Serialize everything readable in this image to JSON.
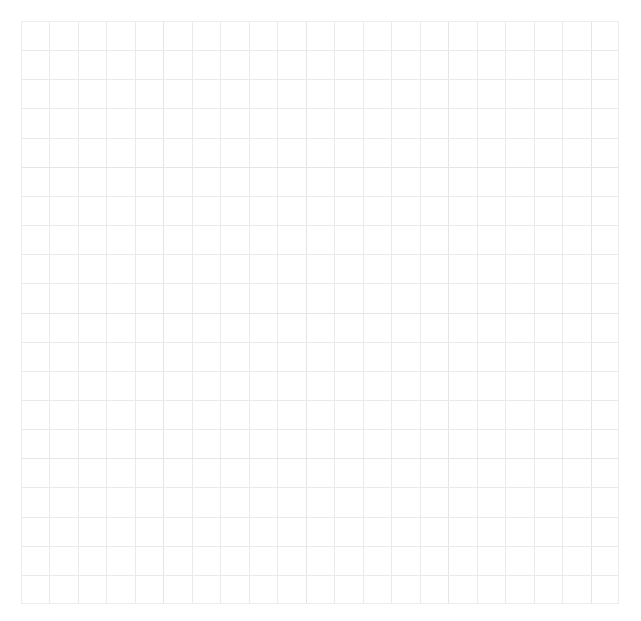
{
  "figure": {
    "background_color": "#ffffff",
    "width": 641,
    "height": 621
  },
  "title": {
    "text": "Figure title (cropped)",
    "visible": false,
    "color": "#9aa0a6"
  },
  "plot": {
    "left": 21,
    "top": 21,
    "width": 598,
    "height": 583,
    "background_color": "#ffffff",
    "border_color": "#eceded"
  },
  "grid": {
    "line_color": "#e9eaec",
    "major_line_color": "#e4e5e8",
    "cell_width": 28.48,
    "cell_height": 28.46,
    "columns": 21,
    "rows": 20,
    "visible": true
  },
  "chart_data": {
    "type": "line",
    "title": "",
    "subtitle": "",
    "xlabel": "",
    "ylabel": "",
    "series": [],
    "categories": [],
    "values": [],
    "annotations": [],
    "legend": {
      "visible": false,
      "position": "none",
      "entries": []
    },
    "xaxis": {
      "tick_labels": [],
      "tick_positions": [
        0,
        1,
        2,
        3,
        4,
        5,
        6,
        7,
        8,
        9,
        10,
        11,
        12,
        13,
        14,
        15,
        16,
        17,
        18,
        19,
        20,
        21
      ],
      "xlim": [
        0,
        21
      ],
      "visible_labels": false
    },
    "yaxis": {
      "tick_labels": [],
      "tick_positions": [
        0,
        1,
        2,
        3,
        4,
        5,
        6,
        7,
        8,
        9,
        10,
        11,
        12,
        13,
        14,
        15,
        16,
        17,
        18,
        19,
        20
      ],
      "ylim": [
        0,
        20
      ],
      "visible_labels": false
    },
    "grid": true
  }
}
